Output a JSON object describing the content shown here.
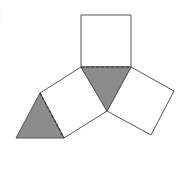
{
  "figure": {
    "partial_label": ":",
    "colors": {
      "stroke": "#555555",
      "shade": "#8c8c8c",
      "background": "#ffffff"
    },
    "shapes": {
      "top_square": [
        [
          81,
          15
        ],
        [
          131,
          15
        ],
        [
          131,
          67
        ],
        [
          81,
          67
        ]
      ],
      "center_triangle": [
        [
          81,
          67
        ],
        [
          131,
          67
        ],
        [
          107,
          111
        ]
      ],
      "left_square": [
        [
          81,
          67
        ],
        [
          40,
          93
        ],
        [
          64,
          138
        ],
        [
          107,
          111
        ]
      ],
      "right_square": [
        [
          131,
          67
        ],
        [
          174,
          91
        ],
        [
          151,
          135
        ],
        [
          107,
          111
        ]
      ],
      "left_triangle": [
        [
          40,
          93
        ],
        [
          16,
          138
        ],
        [
          64,
          138
        ]
      ]
    },
    "dashed_edges": [
      [
        [
          81,
          67
        ],
        [
          131,
          67
        ]
      ],
      [
        [
          40,
          93
        ],
        [
          64,
          138
        ]
      ]
    ]
  }
}
